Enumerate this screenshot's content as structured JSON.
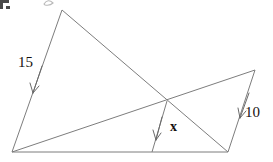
{
  "figure": {
    "kind": "geometry-diagram",
    "background_color": "#ffffff",
    "line_color": "#7d7d7d",
    "text_color": "#15110f",
    "labels": {
      "left_side": "15",
      "right_side": "10",
      "unknown_segment": "x"
    },
    "points": {
      "apex_left": {
        "x": 62,
        "y": 10
      },
      "apex_right": {
        "x": 255,
        "y": 70
      },
      "base_left": {
        "x": 12,
        "y": 152
      },
      "base_right": {
        "x": 228,
        "y": 152
      },
      "intersection": {
        "x": 167,
        "y": 101
      },
      "foot_of_x": {
        "x": 152,
        "y": 152
      }
    },
    "segments": [
      {
        "name": "left-side-15",
        "from": "apex_left",
        "to": "base_left",
        "label": "15"
      },
      {
        "name": "apex-left-to-base-right",
        "from": "apex_left",
        "to": "base_right",
        "label": ""
      },
      {
        "name": "base-left-to-apex-right",
        "from": "base_left",
        "to": "apex_right",
        "label": ""
      },
      {
        "name": "right-side-10",
        "from": "apex_right",
        "to": "base_right",
        "label": "10"
      },
      {
        "name": "baseline",
        "from": "base_left",
        "to": "base_right",
        "label": ""
      },
      {
        "name": "x-segment",
        "from": "intersection",
        "to": "foot_of_x",
        "label": "x"
      }
    ],
    "arrows": [
      {
        "name": "arrow-to-left-side",
        "target_segment": "left-side-15",
        "tip": {
          "x": 33,
          "y": 93
        }
      },
      {
        "name": "arrow-to-right-side",
        "target_segment": "right-side-10",
        "tip": {
          "x": 240,
          "y": 118
        }
      },
      {
        "name": "arrow-to-x-segment",
        "target_segment": "x-segment",
        "tip": {
          "x": 156,
          "y": 139
        }
      }
    ],
    "artifacts": {
      "corner_mark": "crop-corner-bracket",
      "top_glyph": "partial-clipped-glyph"
    }
  }
}
